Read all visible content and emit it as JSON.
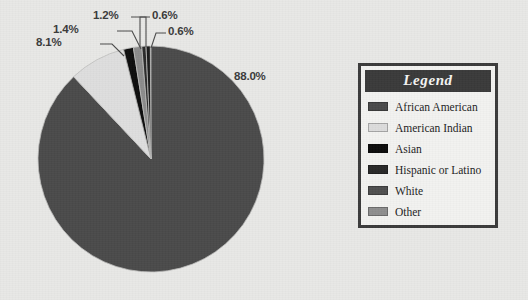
{
  "background_color": "#e8e8e6",
  "chart_data": {
    "type": "pie",
    "title": "",
    "legend_position": "right",
    "grid": false,
    "categories": [
      "African American",
      "American Indian",
      "Asian",
      "Hispanic or Latino",
      "White",
      "Other"
    ],
    "values": [
      88.0,
      8.1,
      1.4,
      1.2,
      0.6,
      0.6
    ],
    "labels": [
      "88.0%",
      "8.1%",
      "1.4%",
      "1.2%",
      "0.6%",
      "0.6%"
    ],
    "colors": [
      "#4a4a4a",
      "#dedede",
      "#0d0d0d",
      "#2a2a2a",
      "#555555",
      "#8c8c8c"
    ],
    "start_angle_deg": -90,
    "direction": "clockwise"
  },
  "pie": {
    "center_x": 151,
    "center_y": 159,
    "radius": 113,
    "slices": [
      {
        "name": "white-slice",
        "label": "88.0%",
        "value": 88.0,
        "color": "#4a4a4a"
      },
      {
        "name": "african-american-slice",
        "label": "8.1%",
        "value": 8.1,
        "color": "#dedede"
      },
      {
        "name": "hispanic-slice",
        "label": "1.4%",
        "value": 1.4,
        "color": "#0d0d0d"
      },
      {
        "name": "other-slice",
        "label": "1.2%",
        "value": 1.2,
        "color": "#8c8c8c"
      },
      {
        "name": "asian-slice",
        "label": "0.6%",
        "value": 0.6,
        "color": "#2a2a2a"
      },
      {
        "name": "american-indian-slice",
        "label": "0.6%",
        "value": 0.6,
        "color": "#1a1a1a"
      }
    ],
    "callouts": [
      {
        "name": "callout-88",
        "text": "88.0%",
        "x": 234,
        "y": 70
      },
      {
        "name": "callout-81",
        "text": "8.1%",
        "x": 66,
        "y": 41
      },
      {
        "name": "callout-14",
        "text": "1.4%",
        "x": 83,
        "y": 28
      },
      {
        "name": "callout-12",
        "text": "1.2%",
        "x": 97,
        "y": 14
      },
      {
        "name": "callout-06-a",
        "text": "0.6%",
        "x": 153,
        "y": 14
      },
      {
        "name": "callout-06-b",
        "text": "0.6%",
        "x": 168,
        "y": 30
      }
    ]
  },
  "legend": {
    "title": "Legend",
    "items": [
      {
        "label": "African American",
        "color": "#4a4a4a"
      },
      {
        "label": "American Indian",
        "color": "#dcdcdc"
      },
      {
        "label": "Asian",
        "color": "#0c0c0c"
      },
      {
        "label": "Hispanic or Latino",
        "color": "#282828"
      },
      {
        "label": "White",
        "color": "#4f4f4f"
      },
      {
        "label": "Other",
        "color": "#8e8e8e"
      }
    ]
  }
}
